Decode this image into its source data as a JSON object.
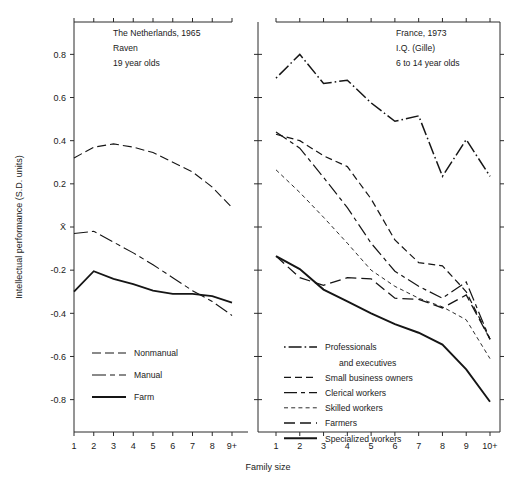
{
  "figure": {
    "xlabel": "Family size",
    "ylabel": "Intellectual performance (S.D. units)",
    "ytick_labels": [
      "0.8",
      "0.6",
      "0.4",
      "0.2",
      "X̄",
      "-0.2",
      "-0.4",
      "-0.6",
      "-0.8"
    ],
    "ytick_values": [
      0.8,
      0.6,
      0.4,
      0.2,
      0.0,
      -0.2,
      -0.4,
      -0.6,
      -0.8
    ],
    "ylim": [
      -0.95,
      0.95
    ]
  },
  "chart_data": [
    {
      "type": "line",
      "panel": "left",
      "title_lines": [
        "The Netherlands, 1965",
        "Raven",
        "19 year olds"
      ],
      "xlabel": "Family size",
      "ylabel": "Intellectual performance (S.D. units)",
      "categories": [
        "1",
        "2",
        "3",
        "4",
        "5",
        "6",
        "7",
        "8",
        "9+"
      ],
      "x": [
        1,
        2,
        3,
        4,
        5,
        6,
        7,
        8,
        9
      ],
      "ylim": [
        -0.95,
        0.95
      ],
      "grid": false,
      "legend_position": "lower-left",
      "series": [
        {
          "name": "Nonmanual",
          "dash": "long-dash",
          "width": 1.1,
          "values": [
            0.32,
            0.37,
            0.385,
            0.37,
            0.345,
            0.3,
            0.255,
            0.185,
            0.09
          ]
        },
        {
          "name": "Manual",
          "dash": "dash-dot-long",
          "width": 1.1,
          "values": [
            -0.03,
            -0.02,
            -0.07,
            -0.12,
            -0.175,
            -0.235,
            -0.295,
            -0.345,
            -0.41
          ]
        },
        {
          "name": "Farm",
          "dash": "solid",
          "width": 1.8,
          "values": [
            -0.3,
            -0.205,
            -0.24,
            -0.265,
            -0.295,
            -0.31,
            -0.31,
            -0.32,
            -0.35
          ]
        }
      ]
    },
    {
      "type": "line",
      "panel": "right",
      "title_lines": [
        "France, 1973",
        "I.Q. (Gille)",
        "6 to 14 year olds"
      ],
      "xlabel": "Family size",
      "categories": [
        "1",
        "2",
        "3",
        "4",
        "5",
        "6",
        "7",
        "8",
        "9",
        "10+"
      ],
      "x": [
        1,
        2,
        3,
        4,
        5,
        6,
        7,
        8,
        9,
        10
      ],
      "ylim": [
        -0.95,
        0.95
      ],
      "grid": false,
      "legend_position": "lower-left",
      "series": [
        {
          "name": "Professionals and executives",
          "dash": "dot-dash",
          "width": 1.5,
          "values": [
            0.69,
            0.8,
            0.665,
            0.68,
            0.575,
            0.49,
            0.515,
            0.235,
            0.405,
            0.235
          ]
        },
        {
          "name": "Small business owners",
          "dash": "dash",
          "width": 1.2,
          "values": [
            0.43,
            0.4,
            0.33,
            0.28,
            0.13,
            -0.06,
            -0.165,
            -0.18,
            -0.3,
            -0.52
          ]
        },
        {
          "name": "Clerical workers",
          "dash": "long-short",
          "width": 1.2,
          "values": [
            0.44,
            0.365,
            0.23,
            0.09,
            -0.075,
            -0.205,
            -0.275,
            -0.33,
            -0.255,
            -0.52
          ]
        },
        {
          "name": "Skilled workers",
          "dash": "fine-dash",
          "width": 0.9,
          "values": [
            0.265,
            0.16,
            0.045,
            -0.075,
            -0.2,
            -0.275,
            -0.33,
            -0.37,
            -0.43,
            -0.61
          ]
        },
        {
          "name": "Farmers",
          "dash": "medium-dash",
          "width": 1.3,
          "values": [
            -0.135,
            -0.235,
            -0.27,
            -0.235,
            -0.24,
            -0.33,
            -0.335,
            -0.375,
            -0.315,
            -0.52
          ]
        },
        {
          "name": "Specialized workers",
          "dash": "solid",
          "width": 1.9,
          "values": [
            -0.135,
            -0.195,
            -0.29,
            -0.345,
            -0.4,
            -0.45,
            -0.49,
            -0.545,
            -0.66,
            -0.81
          ]
        }
      ]
    }
  ],
  "left_panel": {
    "title_lines": [
      "The Netherlands, 1965",
      "Raven",
      "19 year olds"
    ],
    "legend": [
      {
        "label": "Nonmanual"
      },
      {
        "label": "Manual"
      },
      {
        "label": "Farm"
      }
    ]
  },
  "right_panel": {
    "title_lines": [
      "France, 1973",
      "I.Q. (Gille)",
      "6 to 14 year olds"
    ],
    "legend": [
      {
        "label": "Professionals",
        "label2": "and executives"
      },
      {
        "label": "Small business owners"
      },
      {
        "label": "Clerical workers"
      },
      {
        "label": "Skilled workers"
      },
      {
        "label": "Farmers"
      },
      {
        "label": "Specialized workers"
      }
    ]
  },
  "colors": {
    "ink": "#151515",
    "axis": "#2b2b2b",
    "background": "#ffffff"
  }
}
